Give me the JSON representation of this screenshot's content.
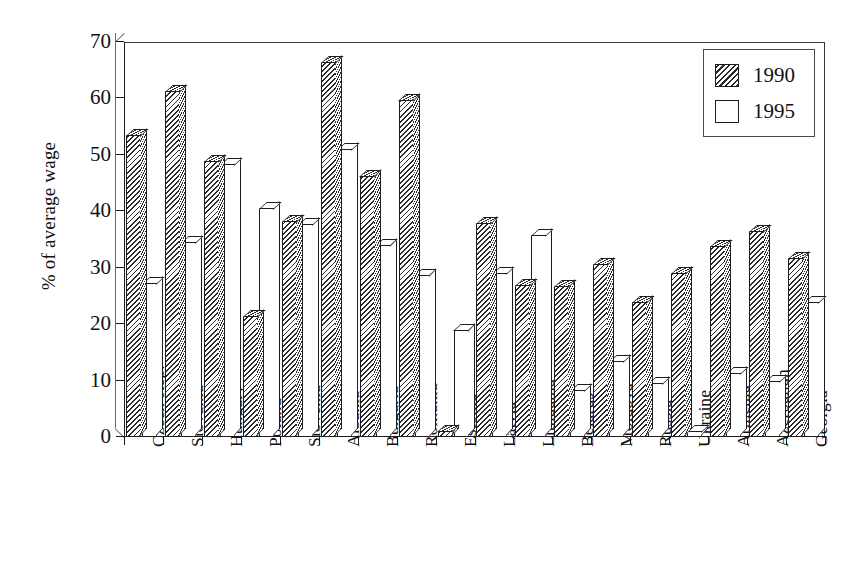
{
  "chart_data": {
    "type": "bar",
    "title": "",
    "xlabel": "",
    "ylabel": "% of average wage",
    "ylim": [
      0,
      70
    ],
    "yticks": [
      0,
      10,
      20,
      30,
      40,
      50,
      60,
      70
    ],
    "grid": false,
    "legend_position": "top-right",
    "categories": [
      "Czech Rep.",
      "Slovakia",
      "Hungary",
      "Poland",
      "Slovenia",
      "Albania",
      "Bulgaria",
      "Romania",
      "Estonia",
      "Latvia",
      "Lithuania",
      "Belarus",
      "Moldova",
      "Russia",
      "Ukraine",
      "Armenia",
      "Azerbaijan",
      "Georgia"
    ],
    "series": [
      {
        "name": "1990",
        "values": [
          53.5,
          61.3,
          49.0,
          21.5,
          38.2,
          66.5,
          46.3,
          59.8,
          1.0,
          38.0,
          27.0,
          26.8,
          30.7,
          24.0,
          29.0,
          33.8,
          36.5,
          31.8
        ]
      },
      {
        "name": "1995",
        "values": [
          27.3,
          34.5,
          48.3,
          40.5,
          37.8,
          51.0,
          34.0,
          28.8,
          19.0,
          29.0,
          35.8,
          8.3,
          13.5,
          9.5,
          1.0,
          11.3,
          10.0,
          24.0
        ]
      }
    ]
  },
  "legend": {
    "entries": [
      {
        "label": "1990",
        "pattern": "hatched"
      },
      {
        "label": "1995",
        "pattern": "solid-white"
      }
    ]
  },
  "axis": {
    "y_title": "% of average wage",
    "y_tick_labels": [
      "0",
      "10",
      "20",
      "30",
      "40",
      "50",
      "60",
      "70"
    ]
  }
}
